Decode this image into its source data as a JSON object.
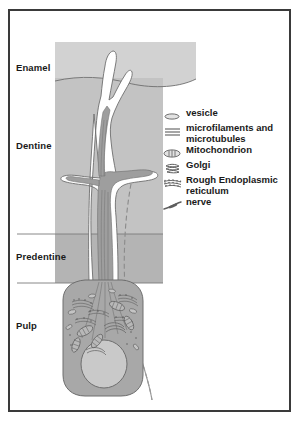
{
  "figure": {
    "border_color": "#3a3a3a",
    "background": "#ffffff"
  },
  "colors": {
    "enamel_fill": "#d2d2d2",
    "dentine_fill": "#c3c3c3",
    "predentine_fill": "#b4b4b4",
    "cell_fill": "#a8a8a8",
    "nucleus_fill": "#c9c9c9",
    "process_fill": "#ffffff",
    "outline": "#555555",
    "text": "#1a1a1a"
  },
  "layers": [
    {
      "id": "enamel",
      "label": "Enamel"
    },
    {
      "id": "dentine",
      "label": "Dentine"
    },
    {
      "id": "predentine",
      "label": "Predentine"
    },
    {
      "id": "pulp",
      "label": "Pulp"
    }
  ],
  "legend": {
    "items": [
      {
        "icon": "vesicle-icon",
        "label": "vesicle"
      },
      {
        "icon": "microfilaments-icon",
        "label": "microfilaments and microtubules"
      },
      {
        "icon": "mitochondrion-icon",
        "label": "Mitochondrion"
      },
      {
        "icon": "golgi-icon",
        "label": "Golgi"
      },
      {
        "icon": "rough-endoplasmic-reticulum-icon",
        "label": "Rough Endoplasmic reticulum"
      },
      {
        "icon": "nerve-icon",
        "label": "nerve"
      }
    ]
  }
}
